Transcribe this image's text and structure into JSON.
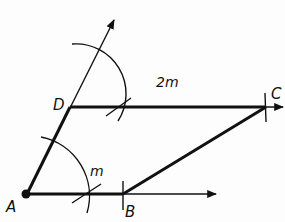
{
  "diagram": {
    "type": "geometric-construction",
    "points": {
      "A": {
        "label": "A",
        "x": 27,
        "y": 194
      },
      "B": {
        "label": "B",
        "x": 123,
        "y": 194
      },
      "C": {
        "label": "C",
        "x": 266,
        "y": 107
      },
      "D": {
        "label": "D",
        "x": 70,
        "y": 107
      }
    },
    "measures": {
      "AB": "m",
      "DC": "2m"
    },
    "colors": {
      "stroke": "#111111",
      "background": "#fdfdfd"
    }
  }
}
